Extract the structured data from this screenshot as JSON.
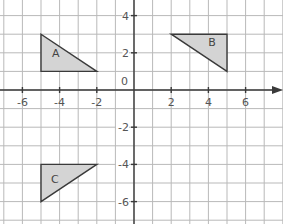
{
  "diagram": {
    "type": "coordinate-grid",
    "origin_label": "0",
    "x_ticks": [
      {
        "value": -6,
        "label": "-6"
      },
      {
        "value": -4,
        "label": "-4"
      },
      {
        "value": -2,
        "label": "-2"
      },
      {
        "value": 2,
        "label": "2"
      },
      {
        "value": 4,
        "label": "4"
      },
      {
        "value": 6,
        "label": "6"
      }
    ],
    "y_ticks": [
      {
        "value": 4,
        "label": "4"
      },
      {
        "value": 2,
        "label": "2"
      },
      {
        "value": -2,
        "label": "-2"
      },
      {
        "value": -4,
        "label": "-4"
      },
      {
        "value": -6,
        "label": "-6"
      }
    ],
    "x_range": [
      -7,
      8
    ],
    "y_range": [
      -7,
      4.5
    ],
    "shapes": [
      {
        "name": "A",
        "label": "A",
        "vertices": [
          [
            -5,
            3
          ],
          [
            -5,
            1
          ],
          [
            -2,
            1
          ]
        ],
        "label_at": [
          -4.2,
          2
        ]
      },
      {
        "name": "B",
        "label": "B",
        "vertices": [
          [
            2,
            3
          ],
          [
            5,
            3
          ],
          [
            5,
            1
          ]
        ],
        "label_at": [
          4.2,
          2.6
        ]
      },
      {
        "name": "C",
        "label": "C",
        "vertices": [
          [
            -5,
            -4
          ],
          [
            -2,
            -4
          ],
          [
            -5,
            -6
          ]
        ],
        "label_at": [
          -4.25,
          -4.8
        ]
      }
    ],
    "colors": {
      "grid": "#b9b9b9",
      "axis": "#3a3a3a",
      "fill": "#d4d4d4",
      "text": "#555555"
    }
  }
}
